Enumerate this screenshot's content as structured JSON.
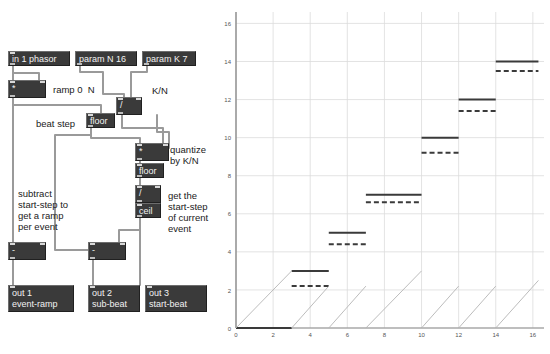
{
  "patch": {
    "nodes": [
      {
        "name": "in-1-phasor",
        "label": "in 1 phasor",
        "x": 8,
        "y": 51,
        "w": 62,
        "h": 15,
        "inlets": 1,
        "outlets": 1
      },
      {
        "name": "param-n-16",
        "label": "param N 16",
        "x": 75,
        "y": 51,
        "w": 62,
        "h": 15,
        "inlets": 0,
        "outlets": 1
      },
      {
        "name": "param-k-7",
        "label": "param K 7",
        "x": 142,
        "y": 51,
        "w": 54,
        "h": 15,
        "inlets": 0,
        "outlets": 1
      },
      {
        "name": "multiply-ramp",
        "label": "*",
        "x": 8,
        "y": 80,
        "w": 38,
        "h": 18,
        "inlets": 2,
        "outlets": 1
      },
      {
        "name": "divide-k-n",
        "label": "/",
        "x": 116,
        "y": 97,
        "w": 26,
        "h": 18,
        "inlets": 2,
        "outlets": 1
      },
      {
        "name": "floor-beat",
        "label": "floor",
        "x": 86,
        "y": 113,
        "w": 29,
        "h": 15,
        "inlets": 1,
        "outlets": 1
      },
      {
        "name": "multiply-quant",
        "label": "*",
        "x": 135,
        "y": 143,
        "w": 34,
        "h": 18,
        "inlets": 2,
        "outlets": 1
      },
      {
        "name": "floor-quant",
        "label": "floor",
        "x": 135,
        "y": 163,
        "w": 29,
        "h": 15,
        "inlets": 1,
        "outlets": 1
      },
      {
        "name": "divide-start",
        "label": "/",
        "x": 135,
        "y": 185,
        "w": 26,
        "h": 18,
        "inlets": 2,
        "outlets": 1
      },
      {
        "name": "ceil-start",
        "label": "ceil",
        "x": 135,
        "y": 203,
        "w": 26,
        "h": 15,
        "inlets": 1,
        "outlets": 1
      },
      {
        "name": "subtract-left",
        "label": "-",
        "x": 8,
        "y": 242,
        "w": 38,
        "h": 18,
        "inlets": 2,
        "outlets": 1
      },
      {
        "name": "subtract-mid",
        "label": "-",
        "x": 88,
        "y": 242,
        "w": 38,
        "h": 18,
        "inlets": 2,
        "outlets": 1
      },
      {
        "name": "out-1",
        "label": "out 1\nevent-ramp",
        "x": 8,
        "y": 285,
        "w": 66,
        "h": 27,
        "inlets": 1,
        "outlets": 0
      },
      {
        "name": "out-2",
        "label": "out 2\nsub-beat",
        "x": 88,
        "y": 285,
        "w": 52,
        "h": 27,
        "inlets": 1,
        "outlets": 0
      },
      {
        "name": "out-3",
        "label": "out 3\nstart-beat",
        "x": 145,
        "y": 285,
        "w": 62,
        "h": 27,
        "inlets": 1,
        "outlets": 0
      }
    ],
    "captions": [
      {
        "name": "caption-ramp",
        "text": "ramp 0  N",
        "x": 53,
        "y": 84
      },
      {
        "name": "caption-k-over-n",
        "text": "K/N",
        "x": 152,
        "y": 85
      },
      {
        "name": "caption-beat-step",
        "text": "beat step",
        "x": 36,
        "y": 118
      },
      {
        "name": "caption-quantize",
        "text": "quantize\nby K/N",
        "x": 170,
        "y": 144
      },
      {
        "name": "caption-subtract",
        "text": "subtract\nstart-step to\nget a ramp\nper event",
        "x": 18,
        "y": 188
      },
      {
        "name": "caption-start-step",
        "text": "get the\nstart-step\nof current\nevent",
        "x": 168,
        "y": 190
      }
    ],
    "wires": [
      "M 13,66 L 13,80",
      "M 13,66 L 13,73 L 39,73 L 39,80",
      "M 80,66 L 80,72 L 103,72 L 103,94 L 124,94 L 124,97",
      "M 147,66 L 147,72 L 131,72 L 131,97",
      "M 13,98 L 13,242",
      "M 13,98 L 13,105 L 101,105 L 101,113",
      "M 91,128 L 91,135 L 55,135 L 55,250 L 93,250",
      "M 91,128 L 91,138 L 140,138 L 140,143",
      "M 122,115 L 122,128 L 163,128 L 163,143",
      "M 140,161 L 140,163",
      "M 140,178 L 140,185",
      "M 157,115 L 157,132 L 169,132 L 169,148",
      "M 140,201 L 140,203",
      "M 140,218 L 140,230 L 119,230 L 119,242",
      "M 140,218 L 140,285",
      "M 13,260 L 13,285",
      "M 93,260 L 93,285"
    ]
  },
  "chart_data": {
    "type": "line",
    "title": "",
    "xlabel": "",
    "ylabel": "",
    "xlim": [
      0,
      16.6
    ],
    "ylim": [
      0,
      16.6
    ],
    "xticks": [
      0,
      2,
      4,
      6,
      8,
      10,
      12,
      14,
      16
    ],
    "yticks": [
      0,
      2,
      4,
      6,
      8,
      10,
      12,
      14,
      16
    ],
    "grid": true,
    "legend_position": "none",
    "series": [
      {
        "name": "start-beat",
        "style": "solid",
        "color": "#3a3a3a",
        "steps": [
          {
            "x0": 0,
            "x1": 3,
            "y": 0
          },
          {
            "x0": 3,
            "x1": 5,
            "y": 3
          },
          {
            "x0": 5,
            "x1": 7,
            "y": 5
          },
          {
            "x0": 7,
            "x1": 10,
            "y": 7
          },
          {
            "x0": 10,
            "x1": 12,
            "y": 10
          },
          {
            "x0": 12,
            "x1": 14,
            "y": 12
          },
          {
            "x0": 14,
            "x1": 16.3,
            "y": 14
          }
        ]
      },
      {
        "name": "sub-beat",
        "style": "dashed",
        "color": "#3a3a3a",
        "steps": [
          {
            "x0": 3,
            "x1": 5,
            "y": 2.2
          },
          {
            "x0": 5,
            "x1": 7,
            "y": 4.4
          },
          {
            "x0": 7,
            "x1": 10,
            "y": 6.6
          },
          {
            "x0": 10,
            "x1": 12,
            "y": 9.2
          },
          {
            "x0": 12,
            "x1": 14,
            "y": 11.4
          },
          {
            "x0": 14,
            "x1": 16.3,
            "y": 13.5
          }
        ]
      },
      {
        "name": "event-ramp",
        "style": "thin",
        "color": "#b4b4b4",
        "ramps": [
          {
            "x0": 0,
            "x1": 3,
            "y0": 0,
            "y1": 3
          },
          {
            "x0": 3,
            "x1": 5,
            "y0": 0,
            "y1": 2.2
          },
          {
            "x0": 5,
            "x1": 7,
            "y0": 0,
            "y1": 2.2
          },
          {
            "x0": 7,
            "x1": 10,
            "y0": 0,
            "y1": 3
          },
          {
            "x0": 10,
            "x1": 12,
            "y0": 0,
            "y1": 2.2
          },
          {
            "x0": 12,
            "x1": 14,
            "y0": 0,
            "y1": 2.2
          },
          {
            "x0": 14,
            "x1": 16.3,
            "y0": 0,
            "y1": 2.5
          }
        ]
      }
    ]
  }
}
